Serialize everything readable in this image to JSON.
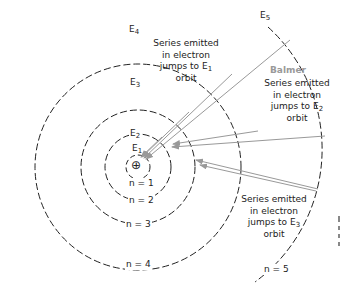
{
  "diagram": {
    "type": "Bohr model energy levels with emission series",
    "nucleus_symbol": "⊕",
    "orbits": [
      {
        "n": "n = 1",
        "energy": "E",
        "sub": "1"
      },
      {
        "n": "n = 2",
        "energy": "E",
        "sub": "2"
      },
      {
        "n": "n = 3",
        "energy": "E",
        "sub": "3"
      },
      {
        "n": "n = 4",
        "energy": "E",
        "sub": "4"
      },
      {
        "n": "n = 5",
        "energy": "E",
        "sub": "5"
      }
    ],
    "series": [
      {
        "lines": [
          "Series emitted",
          "in electron",
          "jumps to E",
          "orbit"
        ],
        "sub": "1"
      },
      {
        "name": "Balmer",
        "lines": [
          "Series emitted",
          "in electron",
          "jumps to E",
          "orbit"
        ],
        "sub": "2"
      },
      {
        "lines": [
          "Series emitted",
          "in electron",
          "jumps to E",
          "orbit"
        ],
        "sub": "3"
      }
    ],
    "colors": {
      "orbit": "#222222",
      "arrow": "#999999",
      "balmer": "#999999"
    }
  }
}
